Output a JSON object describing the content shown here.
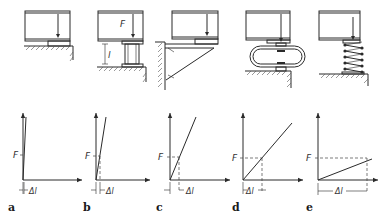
{
  "figure": {
    "panels": [
      {
        "id": "a",
        "label": "a",
        "support": "rigid-pad",
        "force_label": "",
        "length_label": "",
        "chart": {
          "F_label": "F",
          "dl_label": "Δl",
          "stiffness": "very-high"
        }
      },
      {
        "id": "b",
        "label": "b",
        "support": "column",
        "force_label": "F",
        "length_label": "l",
        "chart": {
          "F_label": "F",
          "dl_label": "Δl",
          "stiffness": "high"
        }
      },
      {
        "id": "c",
        "label": "c",
        "support": "bracket",
        "force_label": "",
        "length_label": "",
        "chart": {
          "F_label": "F",
          "dl_label": "Δl",
          "stiffness": "medium"
        }
      },
      {
        "id": "d",
        "label": "d",
        "support": "loop-spring",
        "force_label": "",
        "length_label": "",
        "chart": {
          "F_label": "F",
          "dl_label": "Δl",
          "stiffness": "low"
        }
      },
      {
        "id": "e",
        "label": "e",
        "support": "coil-spring",
        "force_label": "",
        "length_label": "",
        "chart": {
          "F_label": "F",
          "dl_label": "Δl",
          "stiffness": "very-low"
        }
      }
    ]
  },
  "colors": {
    "line": "#2a2a2a",
    "hatch": "#555555",
    "background": "#ffffff"
  }
}
